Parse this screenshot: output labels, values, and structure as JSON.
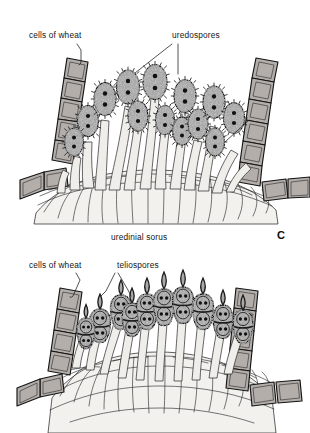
{
  "figure": {
    "background_color": "#ffffff",
    "ink_color": "#1a1a1a"
  },
  "palette": {
    "spore_fill": "#a9a9a9",
    "spore_outline": "#1c1c1c",
    "nucleus": "#101010",
    "stalk_fill": "#efeeea",
    "stalk_outline": "#2b2b2b",
    "wheat_cell_fill": "#b3aeaa",
    "wheat_cell_outline": "#141414",
    "mesophyll_fill": "#f2f1ee",
    "mesophyll_outline": "#1e1e1e",
    "label_color": "#141414"
  },
  "panels": [
    {
      "id": "uredinial",
      "panel_label": "C",
      "caption": "uredinial sorus",
      "labels": [
        {
          "name": "cells-of-wheat",
          "text": "cells of wheat",
          "x": 29,
          "y": 38
        },
        {
          "name": "uredospores",
          "text": "uredospores",
          "x": 172,
          "y": 38
        }
      ],
      "spore": {
        "type": "uredospore",
        "wall": "echinulate",
        "cells": 1,
        "nuclei_per_spore": 2,
        "count": 13
      },
      "wheat_cell_chains": [
        {
          "side": "left",
          "cells": 5
        },
        {
          "side": "right",
          "cells": 5
        }
      ]
    },
    {
      "id": "telial",
      "panel_label": "",
      "caption": "",
      "labels": [
        {
          "name": "cells-of-wheat",
          "text": "cells of wheat",
          "x": 29,
          "y": 268
        },
        {
          "name": "teliospores",
          "text": "teliospores",
          "x": 117,
          "y": 268
        }
      ],
      "spore": {
        "type": "teliospore",
        "wall": "smooth",
        "cells": 2,
        "nuclei_per_cell": 2,
        "count": 10
      },
      "wheat_cell_chains": [
        {
          "side": "left",
          "cells": 5
        },
        {
          "side": "right",
          "cells": 6
        }
      ]
    }
  ]
}
